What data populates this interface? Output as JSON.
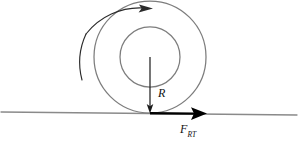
{
  "figure": {
    "type": "physics-free-body-diagram",
    "width": 306,
    "height": 149,
    "background_color": "#ffffff"
  },
  "colors": {
    "circle_stroke": "#7d7d7d",
    "ground_stroke": "#8a8a8a",
    "radius_arrow": "#1a1a1a",
    "rotation_arrow": "#2b2b2b",
    "force_arrow": "#000000",
    "label_text": "#111111"
  },
  "labels": {
    "radius": {
      "text": "R",
      "x": 158,
      "y": 97
    },
    "force": {
      "text": "F",
      "subscript": "RT",
      "x": 180,
      "y": 133
    }
  },
  "geometry": {
    "center": {
      "x": 150,
      "y": 57
    },
    "outer_circle_radius": 56,
    "inner_circle_radius": 30,
    "contact_point": {
      "x": 150,
      "y": 113
    },
    "ground_line": {
      "x1": 1,
      "y1": 112,
      "x2": 297,
      "y2": 115
    },
    "radius_arrow": {
      "x1": 150,
      "y1": 57,
      "x2": 150,
      "y2": 112
    },
    "force_arrow": {
      "x1": 150,
      "y1": 113,
      "x2": 206,
      "y2": 113
    },
    "rotation_arc": {
      "radius": 68,
      "start_angle_deg": 200,
      "end_angle_deg": 357,
      "arrowhead": {
        "x": 151,
        "y": 8
      }
    }
  }
}
